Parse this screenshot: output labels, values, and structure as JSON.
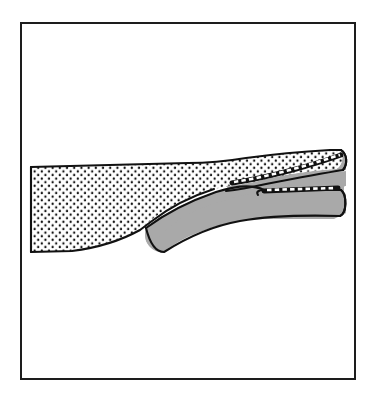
{
  "figure": {
    "title": "Tapered band splitting into two branches",
    "caption": "",
    "background_color": "#ffffff",
    "frame": {
      "name": "figure-border",
      "x": 20,
      "y": 22,
      "width": 336,
      "height": 358,
      "stroke_color": "#1a1a1a",
      "stroke_width": 2,
      "fill": "none"
    },
    "palette": {
      "outline": "#111111",
      "stipple_fill": "#ffffff",
      "stipple_dot": "#111111",
      "gray_fill": "#a9a9a9",
      "stitch_light": "#ffffff",
      "stitch_dark": "#111111",
      "paper": "#ffffff"
    },
    "regions": [
      {
        "name": "stippled-upper-band",
        "fill_style": "stipple",
        "description": "Broad flat band at left with dotted texture, tapering toward the right",
        "dot_spacing": 7,
        "dot_radius": 1.1,
        "path": "M 31 168 L 232 163 C 252 163 268 160 284 157 C 300 154 318 152 336 151 C 340 159 338 165 334 168 C 314 170 296 173 280 176 C 264 179 250 182 232 183 L 150 226 C 122 239 96 247 74 251 L 31 252 Z"
      },
      {
        "name": "gray-lower-band",
        "fill_style": "solid-gray",
        "description": "Gray band emerging from the taper point, running right and forking into two branches",
        "path": "M 146 226 C 172 214 198 202 224 193 C 252 184 286 178 332 176 L 344 176 L 344 214 C 330 220 316 220 304 214 L 262 214 C 226 214 190 222 166 240 C 152 248 146 238 146 226 Z"
      }
    ],
    "branches": [
      {
        "name": "upper-branch",
        "label": "upper limb",
        "tip_x": 344,
        "tip_y": 158,
        "has_stitch_edge": true,
        "stitch_segments": 22
      },
      {
        "name": "lower-branch",
        "label": "lower limb",
        "tip_x": 346,
        "tip_y": 196,
        "has_stitch_edge": true,
        "stitch_segments": 18
      }
    ],
    "fork": {
      "name": "fork-notch",
      "apex_x": 261,
      "apex_y": 190,
      "description": "Notch where the band divides into the upper and lower branches"
    },
    "taper_point": {
      "name": "taper-apex",
      "x": 146,
      "y": 226,
      "description": "Point where the wide stippled band narrows and the gray band begins"
    }
  }
}
